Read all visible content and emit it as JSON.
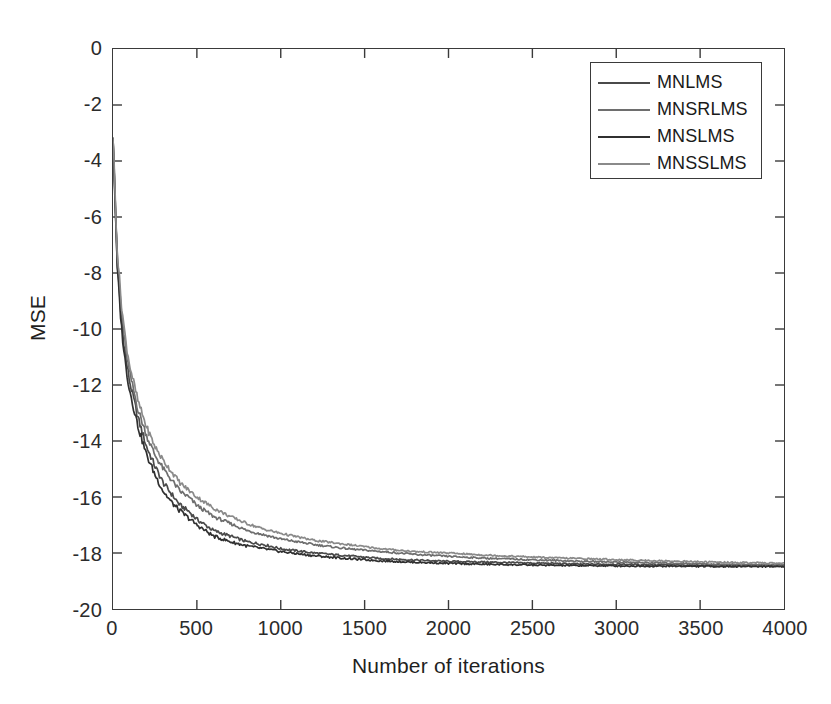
{
  "chart_data": {
    "type": "line",
    "title": "",
    "xlabel": "Number of iterations",
    "ylabel": "MSE",
    "xlim": [
      0,
      4000
    ],
    "ylim": [
      -20,
      0
    ],
    "grid": false,
    "legend_position": "top-right",
    "xticks": [
      0,
      500,
      1000,
      1500,
      2000,
      2500,
      3000,
      3500,
      4000
    ],
    "yticks": [
      0,
      -2,
      -4,
      -6,
      -8,
      -10,
      -12,
      -14,
      -16,
      -18,
      -20
    ],
    "xtick_labels": [
      "0",
      "500",
      "1000",
      "1500",
      "2000",
      "2500",
      "3000",
      "3500",
      "4000"
    ],
    "ytick_labels": [
      "0",
      "-2",
      "-4",
      "-6",
      "-8",
      "-10",
      "-12",
      "-14",
      "-16",
      "-18",
      "-20"
    ],
    "x": [
      0,
      25,
      50,
      75,
      100,
      150,
      200,
      250,
      300,
      350,
      400,
      450,
      500,
      600,
      700,
      800,
      900,
      1000,
      1200,
      1400,
      1600,
      1800,
      2000,
      2200,
      2400,
      2600,
      2800,
      3000,
      3200,
      3400,
      3600,
      3800,
      4000
    ],
    "series": [
      {
        "name": "MNLMS",
        "color": "#4a4a4a",
        "values": [
          -3.1,
          -7.6,
          -9.7,
          -11.0,
          -11.9,
          -13.2,
          -14.2,
          -14.9,
          -15.5,
          -15.9,
          -16.3,
          -16.5,
          -16.8,
          -17.2,
          -17.4,
          -17.6,
          -17.7,
          -17.85,
          -18.0,
          -18.1,
          -18.2,
          -18.25,
          -18.3,
          -18.32,
          -18.35,
          -18.37,
          -18.4,
          -18.4,
          -18.42,
          -18.43,
          -18.44,
          -18.45,
          -18.45
        ]
      },
      {
        "name": "MNSRLMS",
        "color": "#6e6e6e",
        "values": [
          -3.1,
          -7.4,
          -9.4,
          -10.7,
          -11.6,
          -12.9,
          -13.8,
          -14.5,
          -15.0,
          -15.4,
          -15.8,
          -16.0,
          -16.3,
          -16.7,
          -16.95,
          -17.2,
          -17.35,
          -17.5,
          -17.7,
          -17.85,
          -17.95,
          -18.05,
          -18.12,
          -18.18,
          -18.22,
          -18.26,
          -18.3,
          -18.32,
          -18.35,
          -18.37,
          -18.4,
          -18.42,
          -18.43
        ]
      },
      {
        "name": "MNSLMS",
        "color": "#303030",
        "values": [
          -3.1,
          -7.8,
          -9.9,
          -11.3,
          -12.2,
          -13.5,
          -14.5,
          -15.2,
          -15.8,
          -16.2,
          -16.5,
          -16.75,
          -17.0,
          -17.4,
          -17.6,
          -17.75,
          -17.85,
          -17.95,
          -18.1,
          -18.2,
          -18.28,
          -18.33,
          -18.37,
          -18.4,
          -18.42,
          -18.44,
          -18.45,
          -18.46,
          -18.47,
          -18.47,
          -18.48,
          -18.48,
          -18.48
        ]
      },
      {
        "name": "MNSSLMS",
        "color": "#8a8a8a",
        "values": [
          -3.1,
          -7.2,
          -9.1,
          -10.4,
          -11.3,
          -12.6,
          -13.5,
          -14.2,
          -14.7,
          -15.1,
          -15.5,
          -15.75,
          -16.0,
          -16.4,
          -16.7,
          -16.95,
          -17.15,
          -17.3,
          -17.55,
          -17.7,
          -17.85,
          -17.95,
          -18.0,
          -18.07,
          -18.12,
          -18.17,
          -18.2,
          -18.24,
          -18.27,
          -18.3,
          -18.33,
          -18.35,
          -18.37
        ]
      }
    ]
  },
  "legend": {
    "entries": [
      {
        "label": "MNLMS"
      },
      {
        "label": "MNSRLMS"
      },
      {
        "label": "MNSLMS"
      },
      {
        "label": "MNSSLMS"
      }
    ]
  },
  "axes": {
    "x_title": "Number of iterations",
    "y_title": "MSE"
  }
}
